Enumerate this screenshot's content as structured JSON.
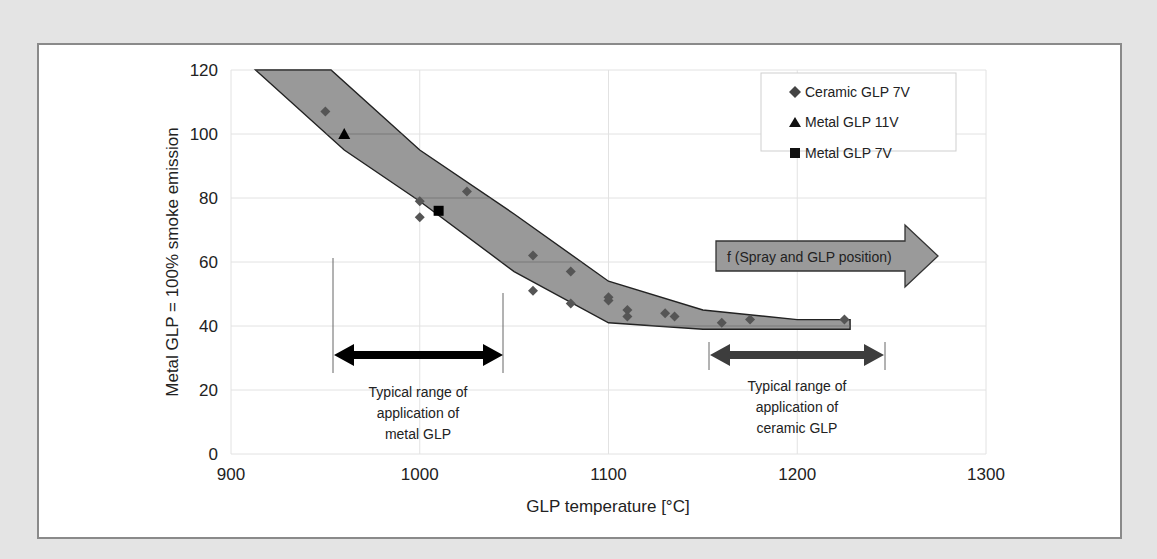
{
  "chart_data": {
    "type": "scatter",
    "title": "",
    "xlabel": "GLP temperature [°C]",
    "ylabel": "Metal GLP = 100% smoke emission",
    "xlim": [
      900,
      1300
    ],
    "ylim": [
      0,
      120
    ],
    "xticks": [
      900,
      1000,
      1100,
      1200,
      1300
    ],
    "yticks": [
      0,
      20,
      40,
      60,
      80,
      100,
      120
    ],
    "grid": true,
    "legend_position": "upper right",
    "series": [
      {
        "name": "Ceramic GLP 7V",
        "marker": "diamond",
        "color": "#555555",
        "x": [
          950,
          1000,
          1000,
          1025,
          1060,
          1060,
          1080,
          1080,
          1100,
          1100,
          1110,
          1110,
          1130,
          1135,
          1160,
          1175,
          1225
        ],
        "y": [
          107,
          79,
          74,
          82,
          62,
          51,
          57,
          47,
          49,
          48,
          45,
          43,
          44,
          43,
          41,
          42,
          42
        ]
      },
      {
        "name": "Metal GLP 11V",
        "marker": "triangle",
        "color": "#000000",
        "x": [
          960
        ],
        "y": [
          100
        ]
      },
      {
        "name": "Metal GLP 7V",
        "marker": "square",
        "color": "#000000",
        "x": [
          1010
        ],
        "y": [
          76
        ]
      }
    ],
    "band": {
      "description": "Shaded scatter band",
      "color": "#999999",
      "upper": [
        [
          913,
          120
        ],
        [
          953,
          120
        ],
        [
          1000,
          95
        ],
        [
          1050,
          75
        ],
        [
          1100,
          54
        ],
        [
          1150,
          45
        ],
        [
          1200,
          42
        ],
        [
          1228,
          42
        ]
      ],
      "lower": [
        [
          913,
          120
        ],
        [
          960,
          95
        ],
        [
          1000,
          79
        ],
        [
          1050,
          57
        ],
        [
          1100,
          41
        ],
        [
          1150,
          39
        ],
        [
          1200,
          39
        ],
        [
          1228,
          39
        ]
      ]
    },
    "annotations": [
      {
        "text": "f (Spray and GLP position)",
        "type": "arrow-right",
        "x_range": [
          1120,
          1290
        ],
        "y": 61
      },
      {
        "text": "Typical range of application of metal GLP",
        "type": "double-arrow",
        "x_range": [
          955,
          1045
        ],
        "y": 31
      },
      {
        "text": "Typical range of application of ceramic GLP",
        "type": "double-arrow",
        "x_range": [
          1155,
          1248
        ],
        "y": 31
      }
    ]
  },
  "labels": {
    "xlabel": "GLP temperature [°C]",
    "ylabel": "Metal GLP = 100% smoke emission",
    "legend": [
      "Ceramic GLP 7V",
      "Metal GLP 11V",
      "Metal GLP 7V"
    ],
    "arrow_text": "f (Spray and GLP position)",
    "metal_range": [
      "Typical range of",
      "application of",
      "metal GLP"
    ],
    "ceramic_range": [
      "Typical range of",
      "application of",
      "ceramic GLP"
    ],
    "xticks": [
      "900",
      "1000",
      "1100",
      "1200",
      "1300"
    ],
    "yticks": [
      "0",
      "20",
      "40",
      "60",
      "80",
      "100",
      "120"
    ]
  }
}
